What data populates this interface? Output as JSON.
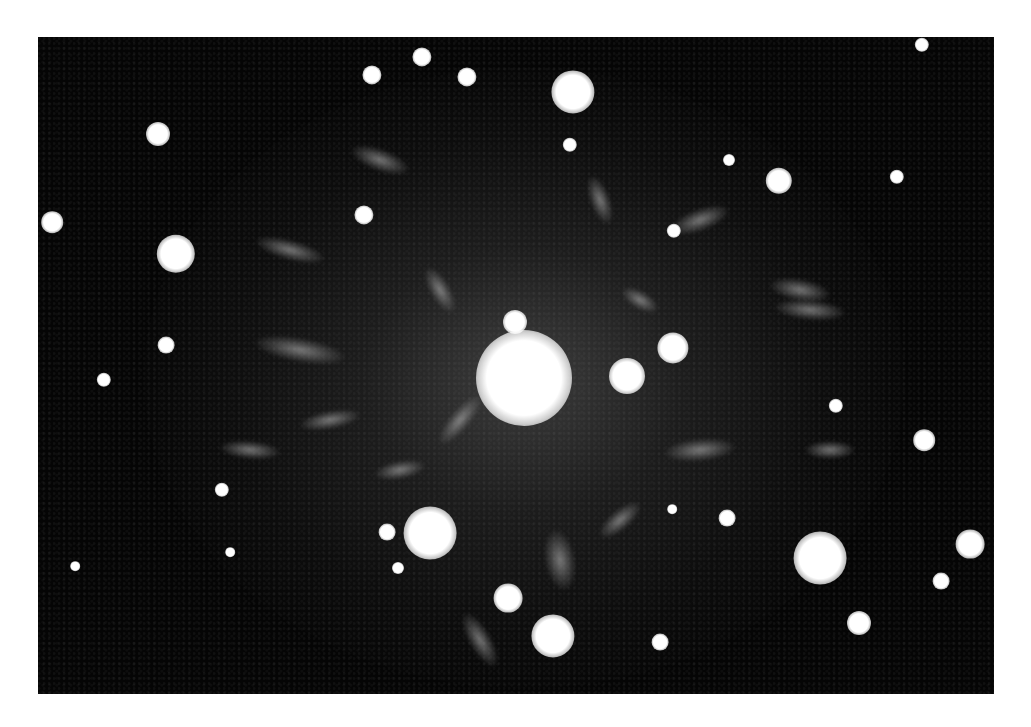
{
  "image": {
    "description": "Electron diffraction pattern: bright central beam surrounded by sharp diffraction spots and diffuse radial streaks on a dark background",
    "colors": {
      "page_background": "#ffffff",
      "image_background": "#050505",
      "spot_color": "#ffffff"
    },
    "frame": {
      "left": 38,
      "top": 37,
      "width": 956,
      "height": 657
    },
    "central_beam": {
      "x": 524,
      "y": 378,
      "r": 40
    },
    "spots": [
      {
        "x": 573,
        "y": 92,
        "r": 18
      },
      {
        "x": 372,
        "y": 75,
        "r": 8
      },
      {
        "x": 422,
        "y": 57,
        "r": 8
      },
      {
        "x": 467,
        "y": 77,
        "r": 8
      },
      {
        "x": 158,
        "y": 134,
        "r": 10
      },
      {
        "x": 52,
        "y": 222,
        "r": 9
      },
      {
        "x": 176,
        "y": 254,
        "r": 16
      },
      {
        "x": 364,
        "y": 215,
        "r": 8
      },
      {
        "x": 166,
        "y": 345,
        "r": 7
      },
      {
        "x": 570,
        "y": 145,
        "r": 6
      },
      {
        "x": 729,
        "y": 160,
        "r": 5
      },
      {
        "x": 779,
        "y": 181,
        "r": 11
      },
      {
        "x": 674,
        "y": 231,
        "r": 6
      },
      {
        "x": 897,
        "y": 177,
        "r": 6
      },
      {
        "x": 922,
        "y": 45,
        "r": 6
      },
      {
        "x": 515,
        "y": 322,
        "r": 10
      },
      {
        "x": 673,
        "y": 348,
        "r": 13
      },
      {
        "x": 627,
        "y": 376,
        "r": 15
      },
      {
        "x": 104,
        "y": 380,
        "r": 6
      },
      {
        "x": 222,
        "y": 490,
        "r": 6
      },
      {
        "x": 430,
        "y": 533,
        "r": 22
      },
      {
        "x": 387,
        "y": 532,
        "r": 7
      },
      {
        "x": 398,
        "y": 568,
        "r": 5
      },
      {
        "x": 508,
        "y": 598,
        "r": 12
      },
      {
        "x": 75,
        "y": 566,
        "r": 4
      },
      {
        "x": 230,
        "y": 552,
        "r": 4
      },
      {
        "x": 924,
        "y": 440,
        "r": 9
      },
      {
        "x": 727,
        "y": 518,
        "r": 7
      },
      {
        "x": 820,
        "y": 558,
        "r": 22
      },
      {
        "x": 970,
        "y": 544,
        "r": 12
      },
      {
        "x": 941,
        "y": 581,
        "r": 7
      },
      {
        "x": 859,
        "y": 623,
        "r": 10
      },
      {
        "x": 553,
        "y": 636,
        "r": 18
      },
      {
        "x": 660,
        "y": 642,
        "r": 7
      },
      {
        "x": 672,
        "y": 509,
        "r": 4
      },
      {
        "x": 836,
        "y": 406,
        "r": 6
      }
    ],
    "streaks": [
      {
        "x": 380,
        "y": 160,
        "w": 60,
        "h": 22,
        "rot": 20
      },
      {
        "x": 290,
        "y": 250,
        "w": 70,
        "h": 20,
        "rot": 15
      },
      {
        "x": 300,
        "y": 350,
        "w": 90,
        "h": 24,
        "rot": 10
      },
      {
        "x": 330,
        "y": 420,
        "w": 60,
        "h": 18,
        "rot": -10
      },
      {
        "x": 460,
        "y": 420,
        "w": 60,
        "h": 20,
        "rot": -50
      },
      {
        "x": 440,
        "y": 290,
        "w": 50,
        "h": 20,
        "rot": 60
      },
      {
        "x": 600,
        "y": 200,
        "w": 50,
        "h": 20,
        "rot": 70
      },
      {
        "x": 700,
        "y": 220,
        "w": 60,
        "h": 22,
        "rot": -20
      },
      {
        "x": 800,
        "y": 290,
        "w": 60,
        "h": 22,
        "rot": 10
      },
      {
        "x": 810,
        "y": 310,
        "w": 70,
        "h": 20,
        "rot": 5
      },
      {
        "x": 700,
        "y": 450,
        "w": 70,
        "h": 22,
        "rot": -5
      },
      {
        "x": 830,
        "y": 450,
        "w": 50,
        "h": 18,
        "rot": 0
      },
      {
        "x": 560,
        "y": 560,
        "w": 60,
        "h": 30,
        "rot": 80
      },
      {
        "x": 480,
        "y": 640,
        "w": 60,
        "h": 22,
        "rot": 60
      },
      {
        "x": 250,
        "y": 450,
        "w": 60,
        "h": 18,
        "rot": 5
      },
      {
        "x": 400,
        "y": 470,
        "w": 50,
        "h": 18,
        "rot": -10
      },
      {
        "x": 640,
        "y": 300,
        "w": 40,
        "h": 18,
        "rot": 30
      },
      {
        "x": 620,
        "y": 520,
        "w": 50,
        "h": 20,
        "rot": -40
      }
    ]
  }
}
